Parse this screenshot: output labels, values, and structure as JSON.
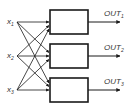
{
  "diagram": {
    "type": "fully-connected block diagram",
    "inputs": [
      {
        "label": "x",
        "subscript": "1"
      },
      {
        "label": "x",
        "subscript": "2"
      },
      {
        "label": "x",
        "subscript": "3"
      }
    ],
    "blocks": [
      {
        "id": "block-1",
        "label": ""
      },
      {
        "id": "block-2",
        "label": ""
      },
      {
        "id": "block-3",
        "label": ""
      }
    ],
    "outputs": [
      {
        "label": "OUT",
        "subscript": "1"
      },
      {
        "label": "OUT",
        "subscript": "2"
      },
      {
        "label": "OUT",
        "subscript": "3"
      }
    ],
    "connections": "each input connects to every block",
    "colors": {
      "stroke": "#1a1a1a",
      "text": "#333333",
      "background": "#ffffff"
    }
  }
}
